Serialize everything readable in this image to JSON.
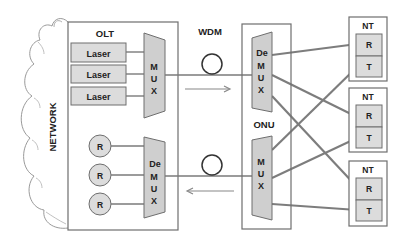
{
  "network": {
    "label": "NETWORK"
  },
  "olt": {
    "label": "OLT",
    "transmitters": [
      {
        "label": "Laser"
      },
      {
        "label": "Laser"
      },
      {
        "label": "Laser"
      }
    ],
    "mux": {
      "letters": [
        "M",
        "U",
        "X"
      ]
    },
    "receivers": [
      {
        "label": "R"
      },
      {
        "label": "R"
      },
      {
        "label": "R"
      }
    ],
    "demux": {
      "letters": [
        "De",
        "M",
        "U",
        "X"
      ]
    }
  },
  "link": {
    "label": "WDM"
  },
  "onu": {
    "label": "ONU",
    "demux": {
      "letters": [
        "De",
        "M",
        "U",
        "X"
      ]
    },
    "mux": {
      "letters": [
        "M",
        "U",
        "X"
      ]
    }
  },
  "terminals": [
    {
      "label": "NT",
      "rx": "R",
      "tx": "T"
    },
    {
      "label": "NT",
      "rx": "R",
      "tx": "T"
    },
    {
      "label": "NT",
      "rx": "R",
      "tx": "T"
    }
  ],
  "colors": {
    "line": "#7a7a7a",
    "box_border": "#6e6e6e",
    "fill": "#dcdcdc",
    "cloud": "#9a9a9a"
  }
}
